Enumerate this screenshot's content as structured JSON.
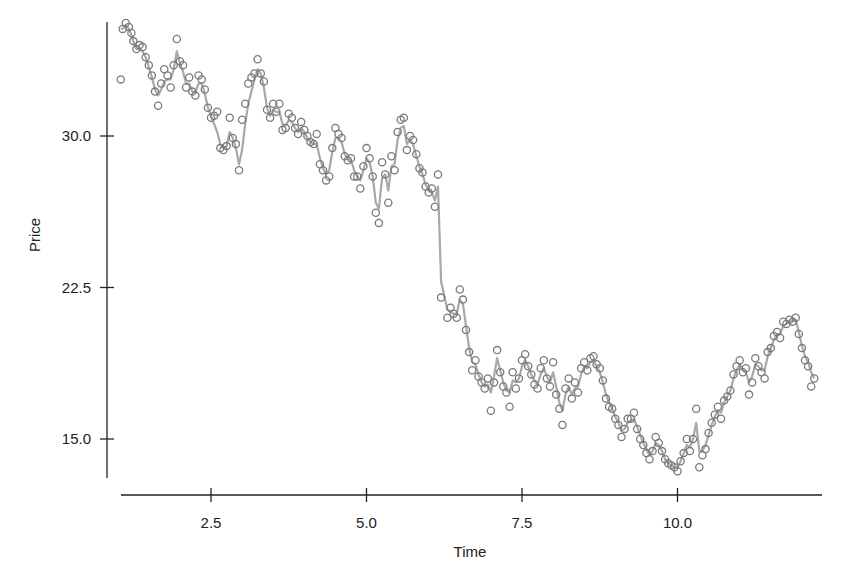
{
  "chart_data": {
    "type": "line",
    "title": "",
    "xlabel": "Time",
    "ylabel": "Price",
    "xlim": [
      1.0,
      12.3
    ],
    "ylim": [
      13.0,
      35.5
    ],
    "xticks": [
      2.5,
      5.0,
      7.5,
      10.0
    ],
    "xtick_labels": [
      "2.5",
      "5.0",
      "7.5",
      "10.0"
    ],
    "yticks": [
      15.0,
      22.5,
      30.0
    ],
    "ytick_labels": [
      "15.0",
      "22.5",
      "30.0"
    ],
    "grid": false,
    "legend": null,
    "series": [
      {
        "name": "observed",
        "style": "open-circle-markers",
        "color": "#7a7a7a"
      },
      {
        "name": "smoothed",
        "style": "line",
        "color": "#a8a8a8"
      }
    ],
    "x": [
      1.05,
      1.08,
      1.13,
      1.18,
      1.22,
      1.25,
      1.3,
      1.35,
      1.4,
      1.45,
      1.5,
      1.55,
      1.6,
      1.65,
      1.7,
      1.75,
      1.8,
      1.85,
      1.9,
      1.95,
      2.0,
      2.05,
      2.1,
      2.15,
      2.2,
      2.25,
      2.3,
      2.35,
      2.4,
      2.45,
      2.5,
      2.55,
      2.6,
      2.65,
      2.7,
      2.75,
      2.8,
      2.85,
      2.9,
      2.95,
      3.0,
      3.05,
      3.1,
      3.15,
      3.2,
      3.25,
      3.3,
      3.35,
      3.4,
      3.45,
      3.5,
      3.55,
      3.6,
      3.65,
      3.7,
      3.75,
      3.8,
      3.85,
      3.9,
      3.95,
      4.0,
      4.05,
      4.1,
      4.15,
      4.2,
      4.25,
      4.3,
      4.35,
      4.4,
      4.45,
      4.5,
      4.55,
      4.6,
      4.65,
      4.7,
      4.75,
      4.8,
      4.85,
      4.9,
      4.95,
      5.0,
      5.05,
      5.1,
      5.15,
      5.2,
      5.25,
      5.3,
      5.35,
      5.4,
      5.45,
      5.5,
      5.55,
      5.6,
      5.65,
      5.7,
      5.75,
      5.8,
      5.85,
      5.9,
      5.95,
      6.0,
      6.05,
      6.1,
      6.15,
      6.2,
      6.3,
      6.35,
      6.4,
      6.45,
      6.5,
      6.55,
      6.6,
      6.65,
      6.7,
      6.75,
      6.8,
      6.85,
      6.9,
      6.95,
      7.0,
      7.05,
      7.1,
      7.15,
      7.2,
      7.25,
      7.3,
      7.35,
      7.4,
      7.45,
      7.5,
      7.55,
      7.6,
      7.65,
      7.7,
      7.75,
      7.8,
      7.85,
      7.9,
      7.95,
      8.0,
      8.05,
      8.1,
      8.15,
      8.2,
      8.25,
      8.3,
      8.35,
      8.4,
      8.45,
      8.5,
      8.55,
      8.6,
      8.65,
      8.7,
      8.75,
      8.8,
      8.85,
      8.9,
      8.95,
      9.0,
      9.05,
      9.1,
      9.15,
      9.2,
      9.25,
      9.3,
      9.35,
      9.4,
      9.45,
      9.5,
      9.55,
      9.6,
      9.65,
      9.7,
      9.75,
      9.8,
      9.85,
      9.9,
      9.95,
      10.0,
      10.05,
      10.1,
      10.15,
      10.2,
      10.25,
      10.3,
      10.35,
      10.4,
      10.45,
      10.5,
      10.55,
      10.6,
      10.65,
      10.7,
      10.75,
      10.8,
      10.85,
      10.9,
      10.95,
      11.0,
      11.05,
      11.1,
      11.15,
      11.2,
      11.25,
      11.3,
      11.35,
      11.4,
      11.45,
      11.5,
      11.55,
      11.6,
      11.65,
      11.7,
      11.75,
      11.8,
      11.85,
      11.9,
      11.95,
      12.0,
      12.05,
      12.1,
      12.15,
      12.2,
      12.25
    ],
    "observed": [
      32.8,
      35.3,
      35.6,
      35.4,
      35.1,
      34.7,
      34.3,
      34.5,
      34.4,
      33.9,
      33.5,
      33.0,
      32.2,
      31.5,
      32.6,
      33.3,
      33.0,
      32.4,
      33.5,
      34.8,
      33.7,
      33.5,
      32.4,
      32.9,
      32.2,
      32.0,
      33.0,
      32.8,
      32.3,
      31.4,
      30.9,
      31.0,
      31.2,
      29.4,
      29.3,
      29.5,
      30.9,
      29.9,
      29.6,
      28.3,
      30.8,
      31.6,
      32.6,
      32.9,
      33.1,
      33.8,
      33.1,
      32.7,
      31.3,
      30.9,
      31.6,
      31.2,
      31.6,
      30.3,
      30.4,
      31.1,
      30.9,
      30.4,
      30.1,
      30.7,
      30.3,
      30.0,
      29.7,
      29.6,
      30.1,
      28.6,
      28.3,
      27.8,
      28.0,
      29.4,
      30.4,
      30.1,
      29.9,
      29.0,
      28.8,
      28.9,
      28.0,
      28.0,
      27.4,
      28.5,
      29.4,
      28.9,
      28.0,
      26.2,
      25.7,
      28.7,
      28.1,
      26.7,
      29.0,
      28.3,
      30.2,
      30.8,
      30.9,
      29.3,
      30.0,
      29.8,
      29.1,
      28.4,
      28.2,
      27.5,
      27.2,
      27.4,
      26.5,
      28.1,
      22.0,
      21.0,
      21.5,
      21.2,
      21.0,
      22.4,
      21.9,
      20.4,
      19.3,
      18.4,
      18.9,
      18.1,
      17.8,
      17.5,
      18.0,
      16.4,
      17.8,
      19.4,
      18.3,
      17.6,
      17.3,
      16.6,
      18.3,
      17.5,
      18.0,
      18.9,
      19.2,
      18.6,
      18.2,
      17.7,
      17.5,
      18.5,
      18.9,
      18.0,
      17.6,
      18.8,
      17.2,
      16.5,
      15.7,
      17.5,
      18.0,
      17.0,
      17.8,
      17.3,
      18.5,
      18.8,
      18.4,
      19.0,
      19.1,
      18.7,
      18.5,
      17.9,
      17.0,
      16.6,
      16.5,
      16.0,
      15.7,
      15.1,
      15.5,
      16.0,
      16.0,
      16.3,
      15.5,
      15.0,
      14.7,
      14.3,
      14.0,
      14.4,
      15.1,
      14.8,
      14.4,
      14.0,
      13.8,
      13.7,
      13.6,
      13.4,
      13.9,
      14.3,
      15.0,
      14.4,
      15.0,
      16.5,
      13.6,
      14.2,
      14.5,
      15.3,
      15.8,
      16.2,
      16.6,
      16.0,
      16.9,
      17.1,
      17.4,
      18.2,
      18.6,
      18.9,
      18.3,
      18.5,
      17.2,
      17.8,
      19.0,
      18.6,
      18.3,
      18.0,
      19.3,
      19.5,
      20.1,
      20.3,
      20.0,
      20.8,
      20.7,
      20.9,
      20.8,
      21.0,
      20.2,
      19.5,
      18.9,
      18.6,
      17.6,
      18.0
    ],
    "smoothed": [
      35.3,
      35.3,
      35.5,
      35.3,
      35.0,
      34.7,
      34.3,
      34.3,
      34.2,
      33.9,
      33.4,
      32.9,
      32.3,
      32.0,
      32.3,
      32.7,
      32.8,
      32.8,
      33.3,
      34.2,
      33.6,
      33.2,
      32.6,
      32.6,
      32.2,
      32.2,
      32.6,
      32.6,
      32.1,
      31.4,
      31.0,
      30.6,
      30.2,
      29.6,
      29.4,
      29.5,
      30.2,
      29.9,
      29.4,
      28.6,
      29.3,
      30.6,
      31.6,
      32.2,
      32.8,
      33.3,
      33.1,
      32.4,
      31.4,
      31.0,
      31.3,
      31.2,
      31.2,
      30.6,
      30.5,
      30.8,
      30.7,
      30.4,
      30.2,
      30.4,
      30.2,
      29.9,
      29.7,
      29.6,
      29.6,
      28.9,
      28.4,
      28.1,
      28.3,
      29.2,
      29.9,
      29.9,
      29.7,
      29.1,
      28.9,
      28.8,
      28.3,
      28.0,
      27.8,
      28.3,
      28.9,
      28.7,
      28.0,
      26.7,
      26.4,
      27.9,
      28.1,
      27.3,
      28.5,
      28.6,
      29.8,
      30.4,
      30.5,
      29.6,
      29.8,
      29.6,
      29.0,
      28.5,
      28.1,
      27.6,
      27.3,
      27.2,
      26.8,
      27.5,
      22.8,
      21.4,
      21.3,
      21.2,
      21.2,
      21.9,
      21.7,
      20.6,
      19.5,
      18.8,
      18.7,
      18.2,
      17.8,
      17.6,
      17.7,
      17.3,
      18.1,
      19.0,
      18.4,
      17.8,
      17.4,
      17.3,
      17.9,
      17.8,
      18.0,
      18.6,
      18.9,
      18.6,
      18.2,
      17.9,
      17.7,
      18.2,
      18.5,
      18.1,
      17.8,
      18.3,
      17.6,
      16.8,
      16.4,
      17.2,
      17.6,
      17.2,
      17.5,
      17.6,
      18.2,
      18.6,
      18.5,
      18.8,
      18.9,
      18.6,
      18.3,
      17.8,
      17.2,
      16.8,
      16.5,
      16.1,
      15.8,
      15.4,
      15.5,
      15.8,
      15.9,
      16.0,
      15.6,
      15.2,
      14.8,
      14.5,
      14.2,
      14.4,
      14.8,
      14.7,
      14.4,
      14.0,
      13.8,
      13.7,
      13.6,
      13.6,
      13.9,
      14.3,
      14.7,
      14.6,
      15.0,
      15.8,
      14.4,
      14.4,
      14.7,
      15.2,
      15.7,
      16.1,
      16.4,
      16.3,
      16.8,
      17.1,
      17.4,
      18.0,
      18.4,
      18.7,
      18.4,
      18.3,
      17.8,
      18.1,
      18.7,
      18.6,
      18.4,
      18.4,
      19.1,
      19.5,
      19.9,
      20.2,
      20.2,
      20.6,
      20.7,
      20.8,
      20.9,
      20.9,
      20.3,
      19.6,
      19.1,
      18.8,
      18.3,
      18.0
    ]
  }
}
